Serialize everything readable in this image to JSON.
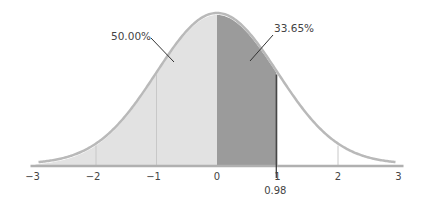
{
  "chart_data": {
    "type": "area",
    "title": "",
    "subtitle": "",
    "xlabel": "",
    "ylabel": "",
    "distribution": "standard normal",
    "xlim": [
      -3,
      3
    ],
    "x_ticks": [
      -3,
      -2,
      -1,
      0,
      1,
      2,
      3
    ],
    "x_tick_labels": [
      "−3",
      "−2",
      "−1",
      "0",
      "1",
      "2",
      "3"
    ],
    "grid_lines_x": [
      -2,
      -1,
      1,
      2
    ],
    "shaded_regions": [
      {
        "name": "left-half",
        "from": -3,
        "to": 0,
        "area_percent": 50.0,
        "color": "#e2e2e2"
      },
      {
        "name": "zero-to-z",
        "from": 0,
        "to": 0.98,
        "area_percent": 33.65,
        "color": "#9b9b9b"
      }
    ],
    "annotations": [
      {
        "text": "50.00%",
        "points_to_region": "left-half"
      },
      {
        "text": "33.65%",
        "points_to_region": "zero-to-z"
      },
      {
        "text": "0.98",
        "type": "marker",
        "x": 0.98
      }
    ],
    "legend": null,
    "colors": {
      "curve": "#b9b9b9",
      "axis": "#b0b0b0",
      "gridline": "#c8c8c8",
      "marker": "#333333",
      "text": "#444444"
    }
  },
  "labels": {
    "left_area": "50.00%",
    "right_area": "33.65%",
    "z_marker": "0.98"
  }
}
